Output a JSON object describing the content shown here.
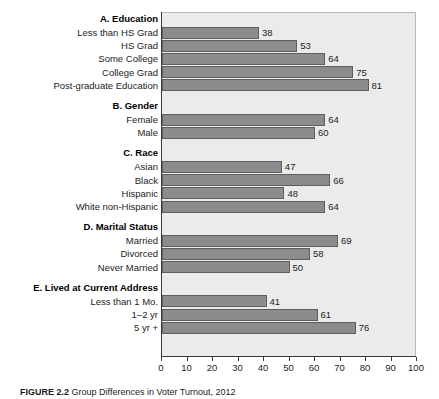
{
  "figure": {
    "caption_label": "FIGURE 2.2",
    "caption_text": "Group Differences in Voter Turnout, 2012"
  },
  "chart_data": {
    "type": "bar",
    "orientation": "horizontal",
    "title": "",
    "xlabel": "",
    "ylabel": "",
    "xlim": [
      0,
      100
    ],
    "xticks": [
      0,
      10,
      20,
      30,
      40,
      50,
      60,
      70,
      80,
      90,
      100
    ],
    "xtick_labels": [
      "0",
      "10",
      "20",
      "30",
      "40",
      "50",
      "60",
      "70",
      "80",
      "90",
      "100"
    ],
    "grid": false,
    "legend": "none",
    "bar_color": "#8c8c8c",
    "bar_edge_color": "#5e5e5e",
    "panel_color": "#ebebeb",
    "groups": [
      {
        "header": "A. Education",
        "categories": [
          "Less than HS Grad",
          "HS Grad",
          "Some College",
          "College Grad",
          "Post-graduate Education"
        ],
        "values": [
          38,
          53,
          64,
          75,
          81
        ]
      },
      {
        "header": "B. Gender",
        "categories": [
          "Female",
          "Male"
        ],
        "values": [
          64,
          60
        ]
      },
      {
        "header": "C. Race",
        "categories": [
          "Asian",
          "Black",
          "Hispanic",
          "White non-Hispanic"
        ],
        "values": [
          47,
          66,
          48,
          64
        ]
      },
      {
        "header": "D. Marital Status",
        "categories": [
          "Married",
          "Divorced",
          "Never Married"
        ],
        "values": [
          69,
          58,
          50
        ]
      },
      {
        "header": "E. Lived at Current Address",
        "categories": [
          "Less than 1 Mo.",
          "1–2 yr",
          "5 yr +"
        ],
        "values": [
          41,
          61,
          76
        ]
      }
    ]
  }
}
